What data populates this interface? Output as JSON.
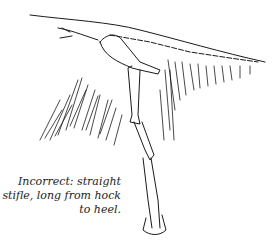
{
  "illustration": {
    "subject": "horse hind leg skeleton with straight stifle",
    "stroke_color": "#1a1a1a"
  },
  "caption": {
    "lines": [
      "Incorrect: straight",
      "stifle, long from hock",
      "to heel."
    ]
  }
}
